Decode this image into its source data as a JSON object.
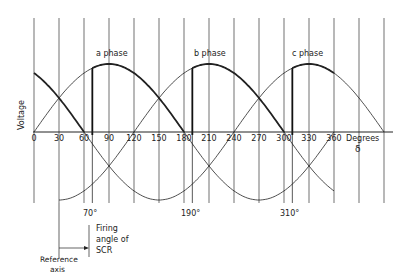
{
  "diagram": {
    "type": "three-phase SCR firing waveform",
    "y_axis_label": "Voltage",
    "x_axis_label": "Degrees",
    "x_axis_symbol": "δ",
    "x_ticks": [
      "0",
      "30",
      "60",
      "90",
      "120",
      "150",
      "180",
      "210",
      "240",
      "270",
      "300",
      "330",
      "360"
    ],
    "phases": [
      {
        "label": "a phase",
        "peak_deg": 90
      },
      {
        "label": "b phase",
        "peak_deg": 210
      },
      {
        "label": "c phase",
        "peak_deg": 330
      }
    ],
    "firing_angles": [
      {
        "label": "70°",
        "deg": 70
      },
      {
        "label": "190°",
        "deg": 190
      },
      {
        "label": "310°",
        "deg": 310
      }
    ],
    "annotation": {
      "line1": "Firing",
      "line2": "angle of",
      "line3": "SCR"
    },
    "reference": {
      "line1": "Reference",
      "line2": "axis"
    }
  }
}
